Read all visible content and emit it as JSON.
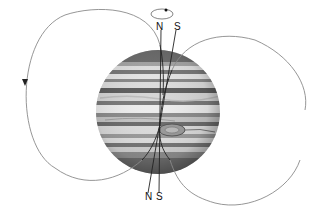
{
  "diagram": {
    "labels": {
      "top_rotation_north": "N",
      "top_magnetic_south": "S",
      "bottom_magnetic_north": "N",
      "bottom_rotation_south": "S"
    },
    "colors": {
      "background": "#ffffff",
      "field_line": "#8a8a8a",
      "axis_line": "#222222",
      "planet_light": "#d9d9d9",
      "planet_dark": "#6e6e6e"
    },
    "elements": [
      "rotation-arrow-ellipse",
      "rotation-axis",
      "magnetic-axis",
      "left-field-loop",
      "right-field-loop",
      "planet-jupiter",
      "great-red-spot"
    ]
  }
}
